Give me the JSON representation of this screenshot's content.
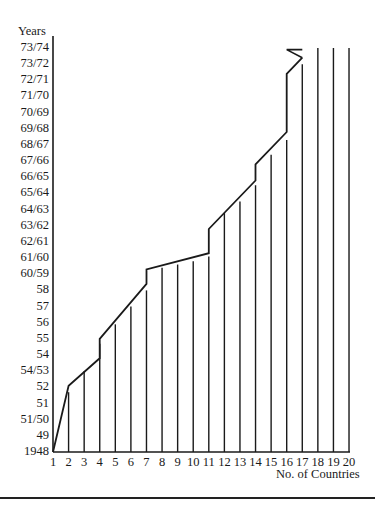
{
  "chart_data": {
    "type": "line",
    "title": "",
    "xlabel": "No. of Countries",
    "ylabel": "Years",
    "x_ticks": [
      "1",
      "2",
      "3",
      "4",
      "5",
      "6",
      "7",
      "8",
      "9",
      "10",
      "11",
      "12",
      "13",
      "14",
      "15",
      "16",
      "17",
      "18",
      "19",
      "20"
    ],
    "y_ticks": [
      "1948",
      "49",
      "51/50",
      "51",
      "52",
      "54/53",
      "54",
      "55",
      "56",
      "57",
      "58",
      "60/59",
      "61/60",
      "62/61",
      "63/62",
      "64/63",
      "65/64",
      "66/65",
      "67/66",
      "68/67",
      "69/68",
      "70/69",
      "71/70",
      "72/71",
      "73/72",
      "73/74"
    ],
    "xlim": [
      1,
      20
    ],
    "grid": false,
    "legend": "none",
    "cumulative_step_line": [
      {
        "x": 1,
        "y_index": 0.0
      },
      {
        "x": 2,
        "y_index": 4.1
      },
      {
        "x": 4,
        "y_index": 5.8
      },
      {
        "x": 4,
        "y_index": 7.0
      },
      {
        "x": 7,
        "y_index": 10.4
      },
      {
        "x": 7,
        "y_index": 11.3
      },
      {
        "x": 11,
        "y_index": 12.3
      },
      {
        "x": 11,
        "y_index": 13.8
      },
      {
        "x": 14,
        "y_index": 16.8
      },
      {
        "x": 14,
        "y_index": 17.8
      },
      {
        "x": 16,
        "y_index": 19.8
      },
      {
        "x": 16,
        "y_index": 23.4
      },
      {
        "x": 17,
        "y_index": 24.4
      },
      {
        "x": 16,
        "y_index": 24.9
      },
      {
        "x": 17,
        "y_index": 24.9
      }
    ],
    "vertical_bars": [
      {
        "x": 2,
        "top_y_index": 3.7
      },
      {
        "x": 3,
        "top_y_index": 5.0
      },
      {
        "x": 4,
        "top_y_index": 6.7
      },
      {
        "x": 5,
        "top_y_index": 7.9
      },
      {
        "x": 6,
        "top_y_index": 9.0
      },
      {
        "x": 7,
        "top_y_index": 10.0
      },
      {
        "x": 8,
        "top_y_index": 11.4
      },
      {
        "x": 9,
        "top_y_index": 11.6
      },
      {
        "x": 10,
        "top_y_index": 11.8
      },
      {
        "x": 11,
        "top_y_index": 12.1
      },
      {
        "x": 12,
        "top_y_index": 14.8
      },
      {
        "x": 13,
        "top_y_index": 15.5
      },
      {
        "x": 14,
        "top_y_index": 16.5
      },
      {
        "x": 15,
        "top_y_index": 18.4
      },
      {
        "x": 16,
        "top_y_index": 19.3
      },
      {
        "x": 17,
        "top_y_index": 24.0
      },
      {
        "x": 18,
        "top_y_index": 25.0
      },
      {
        "x": 19,
        "top_y_index": 25.0
      },
      {
        "x": 20,
        "top_y_index": 25.0
      }
    ]
  },
  "layout": {
    "origin_x": 53,
    "origin_y": 452,
    "x_step": 15.58,
    "y_step": 16.16,
    "axis_top_y": 36,
    "line_color": "#1a1a1a"
  }
}
